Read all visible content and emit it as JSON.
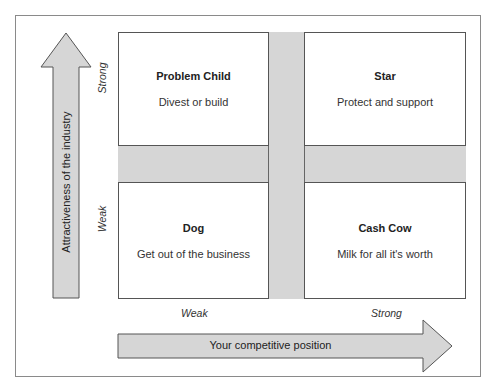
{
  "diagram": {
    "quadrants": {
      "top_left": {
        "title": "Problem Child",
        "description": "Divest or build"
      },
      "top_right": {
        "title": "Star",
        "description": "Protect and support"
      },
      "bottom_left": {
        "title": "Dog",
        "description": "Get out of the business"
      },
      "bottom_right": {
        "title": "Cash Cow",
        "description": "Milk for all it's worth"
      }
    },
    "y_axis": {
      "title": "Attractiveness of the industry",
      "high_label": "Strong",
      "low_label": "Weak"
    },
    "x_axis": {
      "title": "Your competitive position",
      "low_label": "Weak",
      "high_label": "Strong"
    },
    "colors": {
      "arrow_fill": "#d6d6d6",
      "band_fill": "#d6d6d6",
      "border": "#555555"
    }
  }
}
